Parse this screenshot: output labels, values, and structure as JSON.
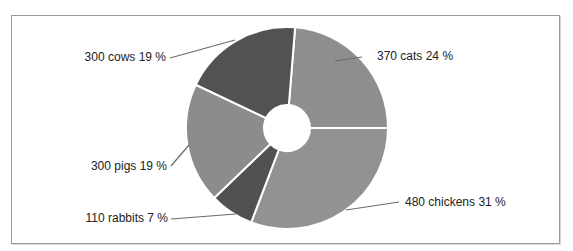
{
  "chart_data": {
    "type": "pie",
    "variant": "donut",
    "title": "",
    "categories": [
      "cats",
      "chickens",
      "rabbits",
      "pigs",
      "cows"
    ],
    "values": [
      370,
      480,
      110,
      300,
      300
    ],
    "percentages": [
      24,
      31,
      7,
      19,
      19
    ],
    "total": 1560,
    "labels": [
      "370 cats 24 %",
      "480 chickens 31 %",
      "110 rabbits 7 %",
      "300 pigs 19 %",
      "300 cows 19 %"
    ],
    "colors": [
      "#8e8e8e",
      "#929292",
      "#515151",
      "#8c8c8c",
      "#525252"
    ],
    "legend": "none",
    "label_position": "outside with leader lines",
    "direction": "clockwise",
    "start_angle_deg": 4.6
  },
  "geometry": {
    "cx": 287,
    "cy": 128,
    "r_outer": 101,
    "r_inner": 23,
    "separator_color": "#ffffff"
  },
  "label_layout": [
    {
      "x": 377,
      "y": 60,
      "anchor": "start",
      "line": [
        362,
        57,
        335,
        61
      ]
    },
    {
      "x": 405,
      "y": 206,
      "anchor": "start",
      "line": [
        399,
        202,
        346,
        210
      ]
    },
    {
      "x": 168,
      "y": 222,
      "anchor": "end",
      "line": [
        171,
        219,
        236,
        214
      ]
    },
    {
      "x": 167,
      "y": 170,
      "anchor": "end",
      "line": [
        171,
        166,
        189,
        145
      ]
    },
    {
      "x": 166,
      "y": 61,
      "anchor": "end",
      "line": [
        170,
        58,
        235,
        40
      ]
    }
  ]
}
